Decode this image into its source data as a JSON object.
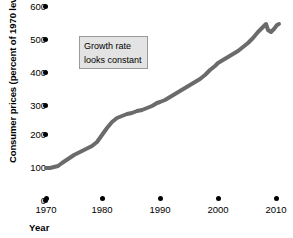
{
  "chart_data": {
    "type": "line",
    "title": "",
    "xlabel": "Year",
    "ylabel": "Consumer prices (percent of 1970 level)",
    "xlim": [
      1968,
      2012
    ],
    "ylim": [
      0,
      620
    ],
    "xticks": [
      1970,
      1980,
      1990,
      2000,
      2010
    ],
    "xticklabels": [
      "1970",
      "1980",
      "1990",
      "2000",
      "2010"
    ],
    "yticks": [
      0,
      100,
      200,
      300,
      400,
      500,
      600
    ],
    "yticklabels": [
      "0",
      "100",
      "200",
      "300",
      "400",
      "500",
      "600"
    ],
    "grid": false,
    "legend": null,
    "line_color": "#6b6b6b",
    "line_width": 4,
    "annotations": [
      {
        "name": "growth-rate-note",
        "lines": [
          "Growth rate",
          "looks constant"
        ],
        "box_fill": "#e3e3e3",
        "box_border": "#9a9a9a"
      }
    ],
    "series": [
      {
        "name": "Consumer prices",
        "x": [
          1970,
          1971,
          1972,
          1973,
          1974,
          1975,
          1976,
          1977,
          1978,
          1979,
          1980,
          1981,
          1982,
          1983,
          1984,
          1985,
          1986,
          1987,
          1988,
          1989,
          1990,
          1991,
          1992,
          1993,
          1994,
          1995,
          1996,
          1997,
          1998,
          1999,
          2000,
          2001,
          2002,
          2003,
          2004,
          2005,
          2006,
          2007,
          2008,
          2009,
          2010
        ],
        "values": [
          100,
          101,
          104,
          109,
          119,
          130,
          136,
          143,
          154,
          172,
          195,
          215,
          228,
          236,
          246,
          254,
          259,
          269,
          280,
          293,
          309,
          322,
          332,
          342,
          351,
          361,
          372,
          380,
          386,
          394,
          408,
          419,
          426,
          436,
          447,
          462,
          477,
          491,
          510,
          508,
          515
        ]
      }
    ],
    "path_points": [
      [
        46,
        168
      ],
      [
        50,
        168
      ],
      [
        54,
        167
      ],
      [
        58,
        166
      ],
      [
        62,
        163
      ],
      [
        68,
        159
      ],
      [
        74,
        155
      ],
      [
        80,
        152
      ],
      [
        86,
        149
      ],
      [
        92,
        146
      ],
      [
        97,
        142
      ],
      [
        102,
        135
      ],
      [
        107,
        128
      ],
      [
        112,
        122
      ],
      [
        117,
        118
      ],
      [
        122,
        116
      ],
      [
        127,
        114
      ],
      [
        132,
        113
      ],
      [
        137,
        111
      ],
      [
        142,
        110
      ],
      [
        147,
        108
      ],
      [
        152,
        106
      ],
      [
        157,
        103
      ],
      [
        160,
        102
      ],
      [
        165,
        100
      ],
      [
        170,
        97
      ],
      [
        175,
        94
      ],
      [
        180,
        91
      ],
      [
        185,
        88
      ],
      [
        190,
        85
      ],
      [
        195,
        82
      ],
      [
        200,
        79
      ],
      [
        205,
        75
      ],
      [
        210,
        70
      ],
      [
        215,
        66
      ],
      [
        218,
        63
      ],
      [
        223,
        60
      ],
      [
        228,
        57
      ],
      [
        233,
        54
      ],
      [
        238,
        51
      ],
      [
        243,
        47
      ],
      [
        248,
        43
      ],
      [
        253,
        38
      ],
      [
        258,
        32
      ],
      [
        263,
        27
      ],
      [
        266,
        24
      ],
      [
        268,
        30
      ],
      [
        271,
        32
      ],
      [
        274,
        29
      ],
      [
        277,
        25
      ],
      [
        279,
        24
      ]
    ]
  },
  "axis": {
    "y_tick_pixels": [
      7,
      40,
      73,
      106,
      135,
      168,
      201
    ],
    "x_tick_pixels": [
      46,
      102,
      160,
      218,
      276
    ]
  }
}
